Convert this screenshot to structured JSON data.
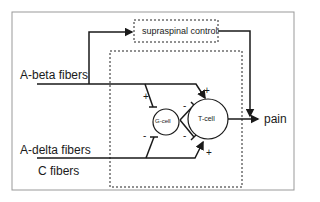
{
  "nodes": {
    "supraspinal": "supraspinal control",
    "g_cell": "G-cell",
    "t_cell": "T-cell",
    "output": "pain"
  },
  "inputs": {
    "a_beta": "A-beta fibers",
    "a_delta": "A-delta fibers",
    "c_fibers": "C fibers"
  },
  "signs": {
    "abeta_to_g": "+",
    "abeta_to_t": "+",
    "g_to_t_upper": "-",
    "g_to_t_lower": "-",
    "small_to_g": "-",
    "small_to_t": "+"
  },
  "colors": {
    "line": "#1a1a1a",
    "border": "#999999"
  }
}
